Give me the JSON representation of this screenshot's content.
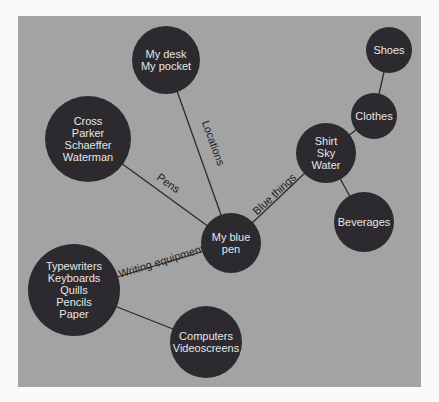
{
  "diagram": {
    "type": "mind-map",
    "background_color": "#a3a3a3",
    "node_color": "#2c2a2e",
    "center": "blue-pen",
    "nodes": [
      {
        "id": "blue-pen",
        "lines": [
          "My blue",
          "pen"
        ],
        "cx": 231,
        "cy": 243,
        "r": 30
      },
      {
        "id": "locations",
        "lines": [
          "My desk",
          "My pocket"
        ],
        "cx": 166,
        "cy": 60,
        "r": 34
      },
      {
        "id": "pens",
        "lines": [
          "Cross",
          "Parker",
          "Schaeffer",
          "Waterman"
        ],
        "cx": 88,
        "cy": 139,
        "r": 43
      },
      {
        "id": "writing",
        "lines": [
          "Typewriters",
          "Keyboards",
          "Quills",
          "Pencils",
          "Paper"
        ],
        "cx": 74,
        "cy": 290,
        "r": 46
      },
      {
        "id": "computers",
        "lines": [
          "Computers",
          "Videoscreens"
        ],
        "cx": 206,
        "cy": 342,
        "r": 36
      },
      {
        "id": "blue-things",
        "lines": [
          "Shirt",
          "Sky",
          "Water"
        ],
        "cx": 326,
        "cy": 153,
        "r": 30
      },
      {
        "id": "clothes",
        "lines": [
          "Clothes"
        ],
        "cx": 374,
        "cy": 116,
        "r": 23
      },
      {
        "id": "shoes",
        "lines": [
          "Shoes"
        ],
        "cx": 389,
        "cy": 50,
        "r": 23
      },
      {
        "id": "beverages",
        "lines": [
          "Beverages"
        ],
        "cx": 364,
        "cy": 222,
        "r": 30
      }
    ],
    "edges": [
      {
        "from": "blue-pen",
        "to": "locations",
        "label": "Locations"
      },
      {
        "from": "blue-pen",
        "to": "pens",
        "label": "Pens"
      },
      {
        "from": "blue-pen",
        "to": "writing",
        "label": "Writing equipment"
      },
      {
        "from": "blue-pen",
        "to": "blue-things",
        "label": "Blue things"
      },
      {
        "from": "writing",
        "to": "computers",
        "label": ""
      },
      {
        "from": "blue-things",
        "to": "clothes",
        "label": ""
      },
      {
        "from": "clothes",
        "to": "shoes",
        "label": ""
      },
      {
        "from": "blue-things",
        "to": "beverages",
        "label": ""
      }
    ]
  }
}
